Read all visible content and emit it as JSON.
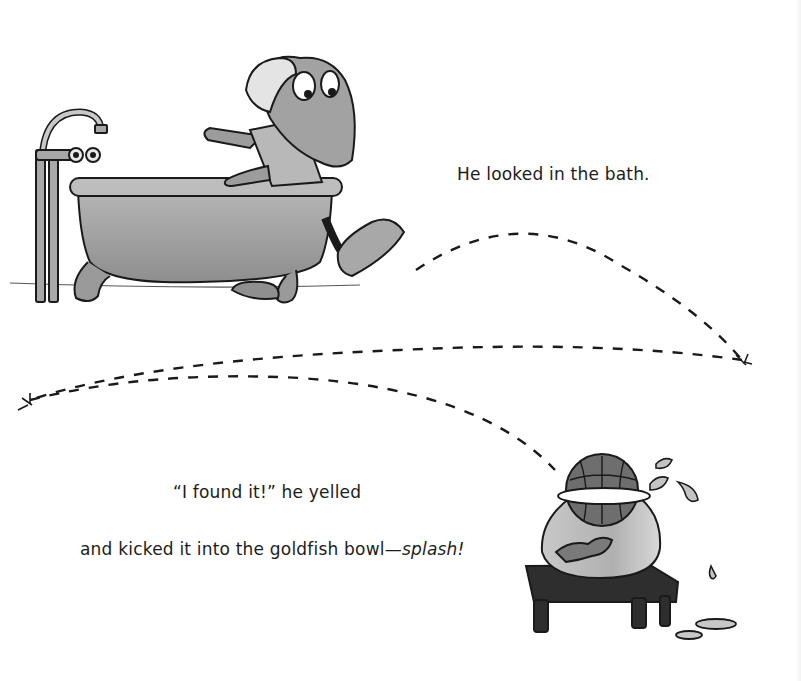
{
  "page": {
    "background": "#ffffff",
    "ink_color": "#1a1a1a",
    "wash_gray": "#9a9a9a"
  },
  "text": {
    "line1": "He looked in the bath.",
    "line2": "“I found it!” he yelled",
    "line3_main": "and kicked it into the goldfish bowl—",
    "line3_emphasis": "splash!"
  },
  "illustration": {
    "scene_top": {
      "elements": [
        "faucet",
        "clawfoot-bathtub",
        "frog-character",
        "swim-cap",
        "sneaker"
      ]
    },
    "ball_path": {
      "style": "dashed",
      "bounce_points": 2
    },
    "scene_bottom": {
      "elements": [
        "beach-ball",
        "goldfish-bowl",
        "goldfish",
        "wooden-stool",
        "water-splashes",
        "puddles"
      ]
    }
  }
}
